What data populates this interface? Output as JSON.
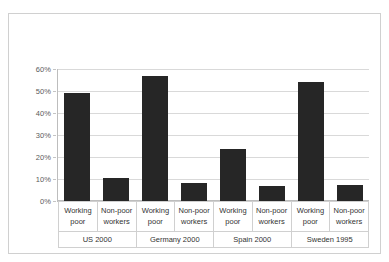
{
  "top_caption": "",
  "chart_data": {
    "type": "bar",
    "title": "",
    "xlabel": "",
    "ylabel": "",
    "ylim": [
      0,
      60
    ],
    "ytick_labels": [
      "0%",
      "10%",
      "20%",
      "30%",
      "40%",
      "50%",
      "60%"
    ],
    "ytick_values": [
      0,
      10,
      20,
      30,
      40,
      50,
      60
    ],
    "grid": true,
    "legend": "none",
    "bar_color": "#262626",
    "groups": [
      {
        "group_label": "US 2000",
        "categories": [
          "Working poor",
          "Non-poor workers"
        ],
        "values": [
          49,
          10.5
        ]
      },
      {
        "group_label": "Germany 2000",
        "categories": [
          "Working poor",
          "Non-poor workers"
        ],
        "values": [
          57,
          8
        ]
      },
      {
        "group_label": "Spain 2000",
        "categories": [
          "Working poor",
          "Non-poor workers"
        ],
        "values": [
          23.5,
          7
        ]
      },
      {
        "group_label": "Sweden 1995",
        "categories": [
          "Working poor",
          "Non-poor workers"
        ],
        "values": [
          54,
          7.5
        ]
      }
    ],
    "categories": [
      "Working poor",
      "Non-poor workers",
      "Working poor",
      "Non-poor workers",
      "Working poor",
      "Non-poor workers",
      "Working poor",
      "Non-poor workers"
    ],
    "values": [
      49,
      10.5,
      57,
      8,
      23.5,
      7,
      54,
      7.5
    ]
  }
}
